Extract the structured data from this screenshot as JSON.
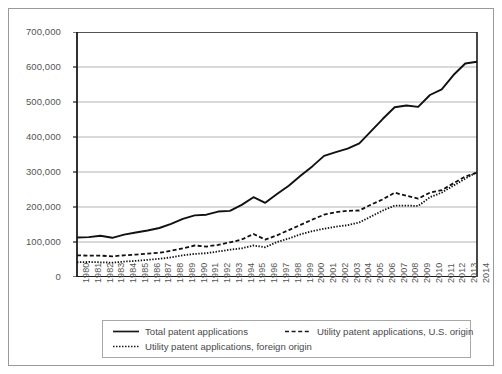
{
  "chart_data": {
    "type": "line",
    "title": "",
    "xlabel": "",
    "ylabel": "",
    "ylim": [
      0,
      700000
    ],
    "yticks": [
      0,
      100000,
      200000,
      300000,
      400000,
      500000,
      600000,
      700000
    ],
    "ytick_labels": [
      "0",
      "100,000",
      "200,000",
      "300,000",
      "400,000",
      "500,000",
      "600,000",
      "700,000"
    ],
    "grid": true,
    "legend_position": "bottom",
    "categories": [
      "1980",
      "1981",
      "1982",
      "1983",
      "1984",
      "1985",
      "1986",
      "1987",
      "1988",
      "1989",
      "1990",
      "1991",
      "1992",
      "1993",
      "1994",
      "1995",
      "1996",
      "1997",
      "1998",
      "1999",
      "2000",
      "2001",
      "2002",
      "2003",
      "2004",
      "2005",
      "2006",
      "2007",
      "2008",
      "2009",
      "2010",
      "2011",
      "2012",
      "2013",
      "2014"
    ],
    "series": [
      {
        "name": "Total patent applications",
        "style": "solid",
        "values": [
          113000,
          114000,
          118000,
          112000,
          121000,
          127000,
          133000,
          140000,
          152000,
          166000,
          176000,
          178000,
          187000,
          189000,
          206000,
          228000,
          212000,
          237000,
          261000,
          289000,
          316000,
          346000,
          357000,
          367000,
          382000,
          417000,
          452000,
          485000,
          490000,
          486000,
          520000,
          536000,
          577000,
          610000,
          615000
        ]
      },
      {
        "name": "Utility patent applications, U.S. origin",
        "style": "dashed",
        "values": [
          62000,
          61000,
          61000,
          59000,
          62000,
          64000,
          67000,
          69000,
          75000,
          82000,
          90000,
          87000,
          92000,
          99000,
          107000,
          123000,
          107000,
          119000,
          134000,
          149000,
          164000,
          178000,
          185000,
          189000,
          190000,
          207000,
          222000,
          241000,
          232000,
          224000,
          241000,
          248000,
          268000,
          287000,
          298000
        ]
      },
      {
        "name": "Utility patent applications, foreign origin",
        "style": "dotted",
        "values": [
          42000,
          43000,
          42000,
          41000,
          44000,
          46000,
          49000,
          52000,
          56000,
          62000,
          66000,
          68000,
          73000,
          78000,
          82000,
          90000,
          85000,
          100000,
          110000,
          122000,
          131000,
          138000,
          144000,
          148000,
          156000,
          173000,
          190000,
          204000,
          204000,
          203000,
          228000,
          241000,
          261000,
          281000,
          300000
        ]
      }
    ]
  },
  "legend": {
    "entries": [
      "Total patent applications",
      "Utility patent applications, U.S. origin",
      "Utility patent applications, foreign origin"
    ]
  }
}
